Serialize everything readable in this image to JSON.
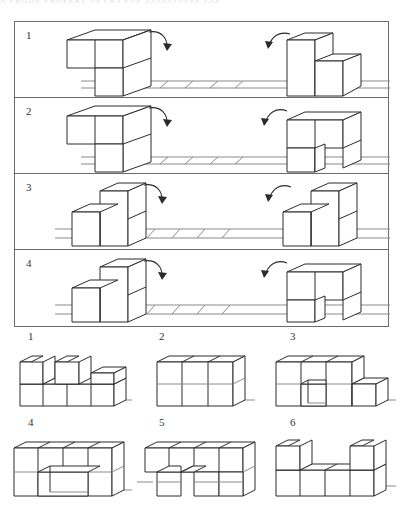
{
  "page": {
    "top_cut_text": "A PRODE PROPERT   SS  PRS        PSS   SSSSSSSSSS  SSS",
    "figure_type": "mental-rotation-block-puzzle"
  },
  "question_panel": {
    "rows": [
      {
        "number": "1",
        "left_figure": "L-shaped block assembly, 3 cubes: two on top row, one below right",
        "right_figure": "step block assembly, tall cube left with lower cube right",
        "left_arrow": "rotation-arrow-clockwise",
        "right_arrow": "rotation-arrow-clockwise",
        "ground": "hatched-ground-line"
      },
      {
        "number": "2",
        "left_figure": "L-shaped block assembly, 3 cubes: two on top row, one below right",
        "right_figure": "L-shaped block assembly mirrored, two cubes top, one below left",
        "left_arrow": "rotation-arrow-clockwise",
        "right_arrow": "rotation-arrow-clockwise",
        "ground": "hatched-ground-line"
      },
      {
        "number": "3",
        "left_figure": "step block assembly, low cube left and tall column right",
        "right_figure": "step block assembly, low cube left and tall column right",
        "left_arrow": "rotation-arrow-clockwise",
        "right_arrow": "rotation-arrow-clockwise",
        "ground": "hatched-ground-line"
      },
      {
        "number": "4",
        "left_figure": "step block assembly, low cube left and tall column right",
        "right_figure": "L-shaped block assembly, two cubes top, one below left",
        "left_arrow": "rotation-arrow-clockwise",
        "right_arrow": "rotation-arrow-clockwise",
        "ground": "hatched-ground-line"
      }
    ]
  },
  "options": {
    "items": [
      {
        "number": "1",
        "description": "4-wide base row with two tall towers separated by a gap and a low step at right"
      },
      {
        "number": "2",
        "description": "solid 3-wide by 2-high rectangular block wall"
      },
      {
        "number": "3",
        "description": "3-wide by 2-high block with notch at bottom centre and low step at right"
      },
      {
        "number": "4",
        "description": "4-wide by 2-high block wall with a rectangular opening in the lower middle"
      },
      {
        "number": "5",
        "description": "4-wide by 2-high block wall with two leg openings at the bottom"
      },
      {
        "number": "6",
        "description": "4-wide base row with a tall tower at each end forming a U shape"
      }
    ]
  },
  "style": {
    "line_color": "#2b2b2b",
    "top_face_color": "#ffffff",
    "side_face_color": "#ffffff",
    "border_color": "#6b6b73",
    "ground_color": "#8a8a90"
  }
}
